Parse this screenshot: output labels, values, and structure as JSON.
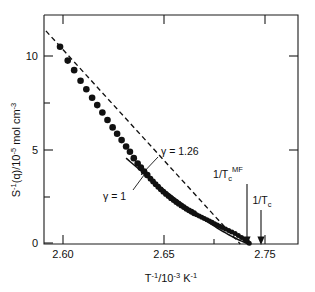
{
  "figure": {
    "title": "",
    "background_color": "#ffffff",
    "ink_color": "#111111"
  },
  "axes": {
    "x": {
      "label": "T",
      "label_sup": "-1",
      "label_mid": "/10",
      "label_sup2": "-3",
      "label_tail": " K",
      "label_sup3": "-1",
      "label_full": "T⁻¹/10⁻³ K⁻¹",
      "ticks_major": [
        "2.60",
        "2.65",
        "2.75"
      ],
      "tick_values": [
        2.6,
        2.65,
        2.75
      ],
      "minor_tick_values": [
        2.7
      ],
      "range": [
        2.585,
        2.783
      ]
    },
    "y": {
      "label_main": "S",
      "label_sup": "-1",
      "label_mid": "(q)/10",
      "label_sup2": "-5",
      "label_tail": " mol cm",
      "label_sup3": "-3",
      "label_full": "S⁻¹(q)/10⁻⁵ mol cm⁻³",
      "ticks_major": [
        "10",
        "5",
        "0"
      ],
      "tick_values": [
        10,
        5,
        0
      ],
      "minor_tick_values": [
        7.5,
        2.5
      ],
      "range": [
        0,
        10.8
      ]
    }
  },
  "annotations": [
    {
      "id": "gamma-126",
      "text": "γ = 1.26",
      "x_px": 160,
      "y_px": 152,
      "leader_from": [
        158,
        156
      ],
      "leader_to": [
        140,
        174
      ]
    },
    {
      "id": "gamma-1",
      "text": "γ = 1",
      "x_px": 104,
      "y_px": 196,
      "leader_from": [
        134,
        190
      ],
      "leader_to": [
        146,
        170
      ]
    },
    {
      "id": "tc-mf",
      "text_main": "1/T",
      "text_sub": "c",
      "text_sup": "MF",
      "text_full": "1/Tᴄᴹᶠ",
      "arrow_x_px": 247,
      "arrow_top_y_px": 182,
      "arrow_bottom_y_px": 243,
      "label_x_px": 228,
      "label_y_px": 176
    },
    {
      "id": "tc",
      "text_main": "1/T",
      "text_sub": "c",
      "text_sup": "",
      "text_full": "1/Tᴄ",
      "arrow_x_px": 261,
      "arrow_top_y_px": 208,
      "arrow_bottom_y_px": 243,
      "label_x_px": 251,
      "label_y_px": 202
    }
  ],
  "chart_data": {
    "type": "scatter",
    "title": "",
    "xlabel": "T⁻¹/10⁻³ K⁻¹",
    "ylabel": "S⁻¹(q)/10⁻⁵ mol cm⁻³",
    "xlim": [
      2.585,
      2.783
    ],
    "ylim": [
      0,
      10.8
    ],
    "grid": false,
    "legend": "none",
    "xticks": [
      2.6,
      2.65,
      2.7,
      2.75
    ],
    "xticklabels": [
      "2.60",
      "2.65",
      "",
      "2.75"
    ],
    "yticks": [
      0,
      2.5,
      5,
      7.5,
      10
    ],
    "yticklabels": [
      "0",
      "",
      "5",
      "",
      "10"
    ],
    "series": [
      {
        "name": "S^-1(q) data",
        "marker": "filled-circle",
        "x": [
          2.5975,
          2.6035,
          2.6085,
          2.6135,
          2.618,
          2.6225,
          2.6265,
          2.6305,
          2.6345,
          2.6385,
          2.642,
          2.6455,
          2.649,
          2.652,
          2.655,
          2.658,
          2.6605,
          2.663,
          2.6655,
          2.668,
          2.67,
          2.672,
          2.674,
          2.676,
          2.678,
          2.68,
          2.682,
          2.684,
          2.686,
          2.688,
          2.69,
          2.692,
          2.694,
          2.696,
          2.698,
          2.7,
          2.702,
          2.704,
          2.706,
          2.708,
          2.71,
          2.712,
          2.714,
          2.716,
          2.718,
          2.72,
          2.722,
          2.724,
          2.7265,
          2.729,
          2.7315,
          2.734,
          2.7365,
          2.739,
          2.7415,
          2.7435,
          2.745
        ],
        "y": [
          9.3,
          8.65,
          8.2,
          7.7,
          7.3,
          6.9,
          6.55,
          6.2,
          5.85,
          5.5,
          5.2,
          4.9,
          4.6,
          4.35,
          4.05,
          3.8,
          3.6,
          3.42,
          3.25,
          3.08,
          2.95,
          2.82,
          2.7,
          2.58,
          2.47,
          2.36,
          2.26,
          2.16,
          2.07,
          1.98,
          1.9,
          1.82,
          1.74,
          1.66,
          1.59,
          1.52,
          1.45,
          1.38,
          1.32,
          1.26,
          1.2,
          1.14,
          1.08,
          1.02,
          0.96,
          0.9,
          0.84,
          0.78,
          0.71,
          0.64,
          0.57,
          0.49,
          0.4,
          0.31,
          0.21,
          0.12,
          0.04
        ]
      }
    ],
    "fits": [
      {
        "name": "gamma = 1 (mean-field)",
        "style": "dashed",
        "exponent": 1.0,
        "x_start": 2.5865,
        "y_start": 10.05,
        "x_end": 2.738,
        "y_end": 0.0,
        "intercept_label": "1/T_c^MF"
      },
      {
        "name": "gamma = 1.26 (Ising)",
        "style": "solid",
        "exponent": 1.26,
        "x_start": 2.649,
        "y_start": 4.05,
        "x_end": 2.7455,
        "y_end": 0.0,
        "intercept_label": "1/T_c"
      }
    ],
    "markers": [
      {
        "label": "1/T_c^MF",
        "x": 2.738
      },
      {
        "label": "1/T_c",
        "x": 2.7455
      }
    ]
  }
}
